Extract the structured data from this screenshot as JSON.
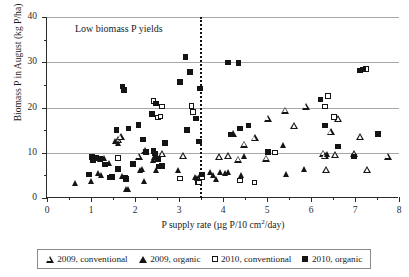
{
  "chart_data": {
    "type": "scatter",
    "title": "",
    "annotation": "Low biomass P yields",
    "xlabel_parts": {
      "pre": "P supply rate (µg P/10 cm",
      "sup": "2",
      "post": "/day)"
    },
    "xlabel": "P supply rate (µg P/10 cm2/day)",
    "ylabel": "Biomass P in August (kg P/ha)",
    "xlim": [
      0,
      8
    ],
    "ylim": [
      0,
      40
    ],
    "xticks": [
      0,
      1,
      2,
      3,
      4,
      5,
      6,
      7,
      8
    ],
    "xtick_labels": [
      "0",
      "1",
      "2",
      "3",
      "4",
      "5",
      "6",
      "7",
      "8"
    ],
    "xminor_step": 0.5,
    "yticks": [
      0,
      10,
      20,
      30,
      40
    ],
    "ytick_labels": [
      "0",
      "10",
      "20",
      "30",
      "40"
    ],
    "yminor_step": 5,
    "grid": "horizontal-major",
    "grid_color": "#a8a8a8",
    "marker_color": "#141414",
    "threshold_line": {
      "x": 3.48,
      "style": "dotted",
      "color": "#111111"
    },
    "legend_position": "below-axes",
    "series": [
      {
        "name": "2009, conventional",
        "marker": "open-triangle",
        "points": [
          [
            1.62,
            12.9
          ],
          [
            1.68,
            13.5
          ],
          [
            2.22,
            10.6
          ],
          [
            2.62,
            9.8
          ],
          [
            2.08,
            9.2
          ],
          [
            3.1,
            9.4
          ],
          [
            3.92,
            9.1
          ],
          [
            4.12,
            9.3
          ],
          [
            4.22,
            14.3
          ],
          [
            4.35,
            8.6
          ],
          [
            4.48,
            11.9
          ],
          [
            4.72,
            13.3
          ],
          [
            4.98,
            8.8
          ],
          [
            5.02,
            17.6
          ],
          [
            5.42,
            19.4
          ],
          [
            5.62,
            16.0
          ],
          [
            5.88,
            20.3
          ],
          [
            6.28,
            9.9
          ],
          [
            6.32,
            9.3
          ],
          [
            6.35,
            6.3
          ],
          [
            6.45,
            14.7
          ],
          [
            6.55,
            9.6
          ],
          [
            6.62,
            17.5
          ],
          [
            6.98,
            9.8
          ],
          [
            7.12,
            13.6
          ],
          [
            7.28,
            6.2
          ],
          [
            7.75,
            9.2
          ]
        ]
      },
      {
        "name": "2009, organic",
        "marker": "filled-triangle",
        "points": [
          [
            0.66,
            3.2
          ],
          [
            1.02,
            3.8
          ],
          [
            1.18,
            5.4
          ],
          [
            1.22,
            8.6
          ],
          [
            1.25,
            5.1
          ],
          [
            1.3,
            8.8
          ],
          [
            1.42,
            7.6
          ],
          [
            1.55,
            12.6
          ],
          [
            1.62,
            12.2
          ],
          [
            1.72,
            4.8
          ],
          [
            1.82,
            2.0
          ],
          [
            1.85,
            1.9
          ],
          [
            2.12,
            6.1
          ],
          [
            2.18,
            6.4
          ],
          [
            2.22,
            3.7
          ],
          [
            2.42,
            8.4
          ],
          [
            2.45,
            9.0
          ],
          [
            2.48,
            6.2
          ],
          [
            3.0,
            6.2
          ],
          [
            3.38,
            4.6
          ],
          [
            3.42,
            4.4
          ],
          [
            3.48,
            5.0
          ],
          [
            3.52,
            4.5
          ],
          [
            3.72,
            5.6
          ],
          [
            3.78,
            5.0
          ],
          [
            3.85,
            4.1
          ],
          [
            3.95,
            5.6
          ],
          [
            4.05,
            5.5
          ],
          [
            4.12,
            5.6
          ],
          [
            4.42,
            5.0
          ],
          [
            4.48,
            9.2
          ],
          [
            5.38,
            11.6
          ],
          [
            5.45,
            5.2
          ],
          [
            5.85,
            6.4
          ],
          [
            6.38,
            9.6
          ]
        ]
      },
      {
        "name": "2010, conventional",
        "marker": "open-square",
        "points": [
          [
            1.62,
            8.8
          ],
          [
            1.8,
            4.2
          ],
          [
            2.42,
            21.4
          ],
          [
            2.62,
            20.2
          ],
          [
            2.52,
            17.8
          ],
          [
            2.58,
            18.0
          ],
          [
            3.02,
            4.3
          ],
          [
            3.28,
            20.3
          ],
          [
            3.32,
            19.0
          ],
          [
            3.42,
            3.6
          ],
          [
            3.46,
            3.4
          ],
          [
            3.52,
            4.6
          ],
          [
            4.38,
            3.9
          ],
          [
            4.72,
            3.4
          ],
          [
            5.18,
            10.1
          ],
          [
            6.32,
            20.2
          ],
          [
            6.38,
            22.6
          ],
          [
            6.52,
            17.9
          ],
          [
            7.25,
            28.5
          ]
        ]
      },
      {
        "name": "2010, organic",
        "marker": "filled-square",
        "points": [
          [
            0.95,
            5.2
          ],
          [
            1.02,
            9.0
          ],
          [
            1.05,
            8.4
          ],
          [
            1.12,
            8.9
          ],
          [
            1.22,
            8.6
          ],
          [
            1.32,
            7.4
          ],
          [
            1.42,
            4.5
          ],
          [
            1.48,
            4.6
          ],
          [
            1.58,
            15.0
          ],
          [
            1.62,
            6.4
          ],
          [
            1.72,
            24.6
          ],
          [
            1.75,
            23.9
          ],
          [
            1.78,
            4.4
          ],
          [
            1.85,
            15.4
          ],
          [
            1.95,
            7.5
          ],
          [
            2.08,
            16.1
          ],
          [
            2.18,
            12.9
          ],
          [
            2.25,
            10.2
          ],
          [
            2.38,
            18.6
          ],
          [
            2.42,
            10.4
          ],
          [
            2.45,
            9.8
          ],
          [
            2.48,
            20.9
          ],
          [
            2.52,
            8.6
          ],
          [
            2.55,
            7.0
          ],
          [
            2.62,
            7.1
          ],
          [
            2.68,
            12.2
          ],
          [
            3.02,
            25.6
          ],
          [
            3.15,
            31.2
          ],
          [
            3.18,
            15.0
          ],
          [
            3.25,
            27.8
          ],
          [
            3.38,
            17.6
          ],
          [
            3.45,
            12.5
          ],
          [
            3.48,
            24.2
          ],
          [
            3.52,
            5.2
          ],
          [
            4.12,
            29.9
          ],
          [
            4.18,
            14.0
          ],
          [
            4.35,
            29.8
          ],
          [
            4.38,
            15.4
          ],
          [
            4.58,
            16.0
          ],
          [
            5.02,
            10.2
          ],
          [
            6.22,
            21.8
          ],
          [
            6.32,
            16.0
          ],
          [
            6.62,
            11.4
          ],
          [
            6.98,
            9.2
          ],
          [
            7.12,
            28.2
          ],
          [
            7.18,
            28.4
          ],
          [
            7.52,
            14.2
          ]
        ]
      }
    ]
  },
  "legend": {
    "items": [
      {
        "label": "2009, conventional",
        "marker": "open-triangle"
      },
      {
        "label": "2009, organic",
        "marker": "filled-triangle"
      },
      {
        "label": "2010, conventional",
        "marker": "open-square"
      },
      {
        "label": "2010, organic",
        "marker": "filled-square"
      }
    ]
  }
}
